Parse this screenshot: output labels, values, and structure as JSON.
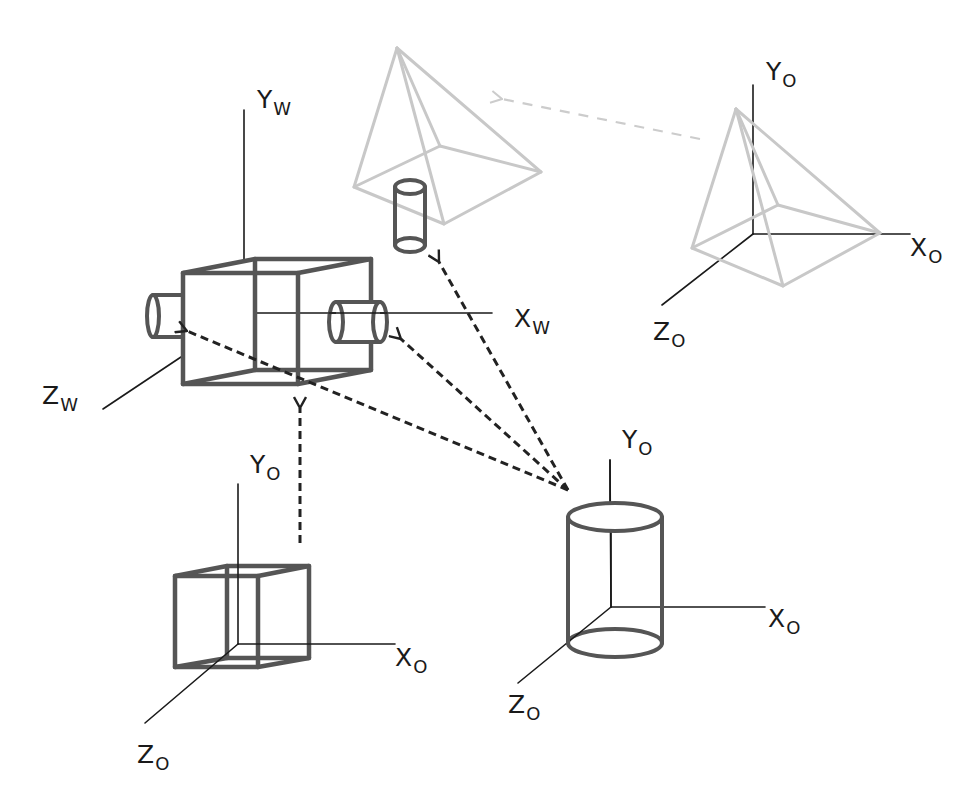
{
  "colors": {
    "background": "#ffffff",
    "axis": "#1a1a1a",
    "object": "#555555",
    "faded": "#c8c8c8",
    "arrow": "#222222",
    "faded_arrow": "#cccccc"
  },
  "world_frame": {
    "name": "world-coordinate-frame",
    "labels": [
      {
        "id": "yw",
        "main": "Y",
        "sub": "W",
        "x": 257,
        "y": 108
      },
      {
        "id": "xw",
        "main": "X",
        "sub": "W",
        "x": 514,
        "y": 327
      },
      {
        "id": "zw",
        "main": "Z",
        "sub": "W",
        "x": 42,
        "y": 404
      }
    ],
    "axes": [
      {
        "id": "y-axis",
        "x1": 244,
        "y1": 110,
        "x2": 244,
        "y2": 259
      },
      {
        "id": "x-axis",
        "x1": 255,
        "y1": 313,
        "x2": 492,
        "y2": 313
      },
      {
        "id": "z-axis",
        "x1": 181,
        "y1": 357,
        "x2": 103,
        "y2": 409
      }
    ]
  },
  "camera_cube": {
    "front": [
      [
        183,
        273
      ],
      [
        298,
        273
      ],
      [
        298,
        384
      ],
      [
        183,
        384
      ]
    ],
    "back": [
      [
        255,
        259
      ],
      [
        371,
        259
      ],
      [
        371,
        370
      ],
      [
        255,
        370
      ]
    ],
    "left_cylinder": {
      "cx": 153,
      "cy": 316,
      "rx": 6,
      "ry": 21,
      "x2": 183
    },
    "right_cylinder": {
      "cx1": 336,
      "cx2": 380,
      "cy": 322,
      "rx": 7,
      "ry": 20
    }
  },
  "faded_pyramid_world": {
    "apex": [
      397,
      48
    ],
    "left": [
      354,
      187
    ],
    "back": [
      440,
      146
    ],
    "right": [
      541,
      172
    ],
    "front": [
      444,
      224
    ]
  },
  "small_cylinder": {
    "cx": 410,
    "top": 187,
    "bottom": 245,
    "rx": 15,
    "ry": 7
  },
  "object_frames": [
    {
      "name": "pyramid-object-frame",
      "faded": true,
      "label_y": {
        "main": "Y",
        "sub": "O",
        "x": 766,
        "y": 80
      },
      "label_x": {
        "main": "X",
        "sub": "O",
        "x": 910,
        "y": 256
      },
      "label_z": {
        "main": "Z",
        "sub": "O",
        "x": 653,
        "y": 340
      },
      "origin": [
        753,
        234
      ],
      "y_end": [
        753,
        85
      ],
      "x_end": [
        910,
        234
      ],
      "z_end": [
        662,
        305
      ],
      "pyramid": {
        "apex": [
          736,
          109
        ],
        "left": [
          692,
          248
        ],
        "back": [
          778,
          205
        ],
        "right": [
          880,
          233
        ],
        "front": [
          783,
          286
        ]
      }
    },
    {
      "name": "cube-object-frame",
      "label_y": {
        "main": "Y",
        "sub": "O",
        "x": 250,
        "y": 473
      },
      "label_x": {
        "main": "X",
        "sub": "O",
        "x": 395,
        "y": 666
      },
      "label_z": {
        "main": "Z",
        "sub": "O",
        "x": 137,
        "y": 763
      },
      "origin": [
        238,
        644
      ],
      "y_end": [
        238,
        484
      ],
      "x_end": [
        395,
        644
      ],
      "z_end": [
        145,
        723
      ],
      "cube": {
        "front": [
          [
            175,
            576
          ],
          [
            258,
            576
          ],
          [
            258,
            667
          ],
          [
            175,
            667
          ]
        ],
        "back": [
          [
            227,
            566
          ],
          [
            309,
            566
          ],
          [
            309,
            658
          ],
          [
            227,
            658
          ]
        ]
      }
    },
    {
      "name": "cylinder-object-frame",
      "label_y": {
        "main": "Y",
        "sub": "O",
        "x": 622,
        "y": 448
      },
      "label_x": {
        "main": "X",
        "sub": "O",
        "x": 768,
        "y": 627
      },
      "label_z": {
        "main": "Z",
        "sub": "O",
        "x": 508,
        "y": 713
      },
      "origin": [
        611,
        607
      ],
      "y_end": [
        610,
        460
      ],
      "x_end": [
        765,
        607
      ],
      "z_end": [
        518,
        683
      ],
      "cylinder": {
        "cx": 615,
        "top": 517,
        "bottom": 643,
        "rx": 47,
        "ry": 14
      }
    }
  ],
  "arrows": [
    {
      "id": "arrow-to-small-cylinder",
      "from": [
        568,
        490
      ],
      "to": [
        439,
        262
      ],
      "style": "dark"
    },
    {
      "id": "arrow-to-right-lens",
      "from": [
        568,
        490
      ],
      "to": [
        401,
        339
      ],
      "style": "dark"
    },
    {
      "id": "arrow-to-left-lens",
      "from": [
        568,
        490
      ],
      "to": [
        187,
        331
      ],
      "style": "dark"
    },
    {
      "id": "arrow-cube-to-camera",
      "from": [
        300,
        543
      ],
      "to": [
        300,
        408
      ],
      "style": "dark"
    },
    {
      "id": "arrow-pyramid-to-world",
      "from": [
        700,
        139
      ],
      "to": [
        502,
        99
      ],
      "style": "faded"
    }
  ]
}
